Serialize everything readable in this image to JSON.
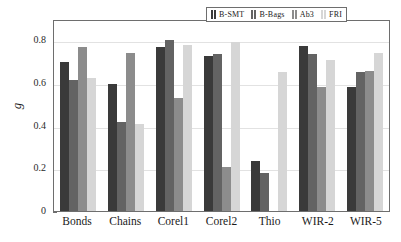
{
  "chart_data": {
    "type": "bar",
    "title": "",
    "xlabel": "",
    "ylabel": "g",
    "ylim": [
      0,
      0.9
    ],
    "yticks": [
      "0",
      "0.2",
      "0.4",
      "0.6",
      "0.8"
    ],
    "ytick_values": [
      0,
      0.2,
      0.4,
      0.6,
      0.8
    ],
    "grid": true,
    "legend_position": "top-right",
    "categories": [
      "Bonds",
      "Chains",
      "Corel1",
      "Corel2",
      "Thio",
      "WIR-2",
      "WIR-5"
    ],
    "series": [
      {
        "name": "B-SMT",
        "color": "#3a3a3a",
        "values": [
          0.7,
          0.595,
          0.77,
          0.725,
          0.235,
          0.773,
          0.583
        ]
      },
      {
        "name": "B-Bags",
        "color": "#636363",
        "values": [
          0.616,
          0.416,
          0.8,
          0.735,
          0.178,
          0.738,
          0.651
        ]
      },
      {
        "name": "Ab3",
        "color": "#8c8c8c",
        "values": [
          0.767,
          0.74,
          0.53,
          0.205,
          null,
          0.582,
          0.655
        ]
      },
      {
        "name": "FRI",
        "color": "#d6d6d6",
        "values": [
          0.623,
          0.409,
          0.778,
          0.792,
          0.651,
          0.71,
          0.742
        ]
      }
    ]
  },
  "legend": {
    "entries": [
      {
        "label": "B-SMT"
      },
      {
        "label": "B-Bags"
      },
      {
        "label": "Ab3"
      },
      {
        "label": "FRI"
      }
    ]
  }
}
